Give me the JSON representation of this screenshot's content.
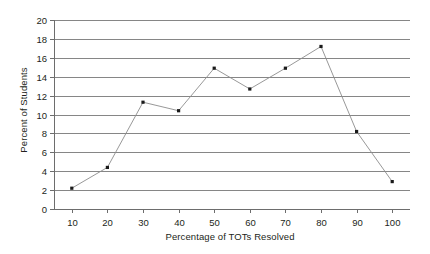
{
  "chart_data": {
    "type": "line",
    "title": "",
    "xlabel": "Percentage of TOTs Resolved",
    "ylabel": "Percent of Students",
    "x": [
      10,
      20,
      30,
      40,
      50,
      60,
      70,
      80,
      90,
      100
    ],
    "values": [
      2.2,
      4.4,
      11.3,
      10.4,
      14.9,
      12.7,
      14.9,
      17.2,
      8.2,
      2.9
    ],
    "series": [
      {
        "name": "Percent of Students",
        "values": [
          2.2,
          4.4,
          11.3,
          10.4,
          14.9,
          12.7,
          14.9,
          17.2,
          8.2,
          2.9
        ]
      }
    ],
    "xtick_labels": [
      "10",
      "20",
      "30",
      "40",
      "50",
      "60",
      "70",
      "80",
      "90",
      "100"
    ],
    "ytick_labels": [
      "0",
      "2",
      "4",
      "6",
      "8",
      "10",
      "12",
      "14",
      "16",
      "18",
      "20"
    ],
    "yticks": [
      0,
      2,
      4,
      6,
      8,
      10,
      12,
      14,
      16,
      18,
      20
    ],
    "xlim": [
      5,
      105
    ],
    "ylim": [
      0,
      20
    ],
    "grid": "horizontal",
    "legend": "none",
    "marker": "square",
    "colors": {
      "background": "#ffffff",
      "line": "#8c8c8c",
      "marker": "#1a1a1a",
      "gridline": "#868686",
      "axis": "#6d6d6d",
      "text": "#231f20"
    }
  }
}
